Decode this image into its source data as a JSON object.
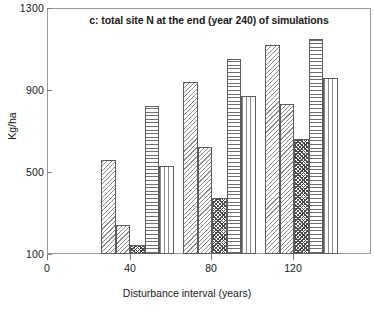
{
  "chart_data": {
    "type": "bar",
    "title": "c: total site N at the end (year 240) of simulations",
    "xlabel": "Disturbance interval (years)",
    "ylabel": "Kg/ha",
    "categories": [
      "40",
      "80",
      "120"
    ],
    "x": [
      40,
      80,
      120
    ],
    "xlim": [
      0,
      160
    ],
    "xticks": [
      0,
      40,
      80,
      120
    ],
    "xtick_labels": [
      "0",
      "40",
      "80",
      "120"
    ],
    "ylim": [
      100,
      1300
    ],
    "yticks": [
      100,
      500,
      900,
      1300
    ],
    "ytick_labels": [
      "100",
      "500",
      "900",
      "1300"
    ],
    "grid": false,
    "legend": "none",
    "series": [
      {
        "name": "series-1",
        "pattern": "diagonal-hatch",
        "values": [
          560,
          940,
          1120
        ]
      },
      {
        "name": "series-2",
        "pattern": "diagonal-hatch-dense",
        "values": [
          240,
          620,
          830
        ]
      },
      {
        "name": "series-3",
        "pattern": "dark-checkerboard",
        "values": [
          145,
          375,
          660
        ]
      },
      {
        "name": "series-4",
        "pattern": "horizontal-lines",
        "values": [
          820,
          1050,
          1150
        ]
      },
      {
        "name": "series-5",
        "pattern": "vertical-lines",
        "values": [
          530,
          870,
          960
        ]
      }
    ]
  },
  "axis": {
    "y_tick_1300": "1300",
    "y_tick_900": "900",
    "y_tick_500": "500",
    "y_tick_100": "100",
    "x_tick_0": "0",
    "x_tick_40": "40",
    "x_tick_80": "80",
    "x_tick_120": "120"
  },
  "colors": {
    "frame": "#9a9a9a",
    "bar_outline": "#5c5c5c",
    "text": "#1a1a1a",
    "background": "#ffffff"
  }
}
